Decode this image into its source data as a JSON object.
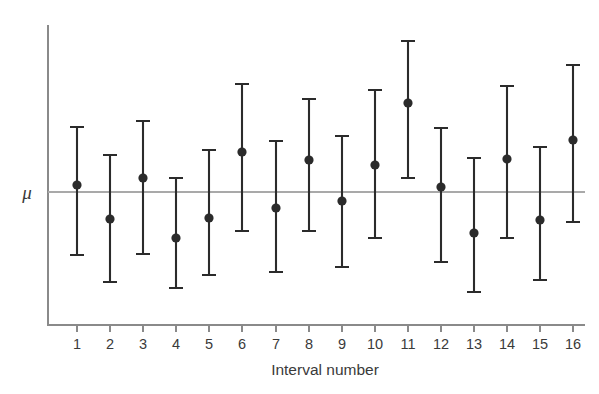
{
  "chart_data": {
    "type": "scatter",
    "title": "",
    "subtitle": "",
    "xlabel": "Interval number",
    "ylabel": "",
    "grid": false,
    "legend": false,
    "annotations": [
      {
        "name": "mu-reference-line",
        "label": "μ",
        "axis": "y",
        "value": 0.0
      }
    ],
    "axis": {
      "x_range": [
        0.4,
        16.6
      ],
      "y_range": [
        -2.6,
        2.6
      ],
      "x_ticks": [
        1,
        2,
        3,
        4,
        5,
        6,
        7,
        8,
        9,
        10,
        11,
        12,
        13,
        14,
        15,
        16
      ],
      "x_tick_labels": [
        "1",
        "2",
        "3",
        "4",
        "5",
        "6",
        "7",
        "8",
        "9",
        "10",
        "11",
        "12",
        "13",
        "14",
        "15",
        "16"
      ],
      "y_ticks": [],
      "y_tick_labels": []
    },
    "categories": [
      1,
      2,
      3,
      4,
      5,
      6,
      7,
      8,
      9,
      10,
      11,
      12,
      13,
      14,
      15,
      16
    ],
    "series": [
      {
        "name": "Confidence interval",
        "point_estimates": [
          0.17,
          -0.8,
          0.42,
          -1.38,
          -0.76,
          1.22,
          -0.49,
          0.99,
          -0.13,
          0.84,
          2.29,
          0.07,
          -1.28,
          1.06,
          -0.83,
          1.68
        ],
        "ci_upper": [
          1.92,
          1.17,
          2.11,
          0.42,
          1.32,
          3.22,
          1.52,
          2.75,
          1.77,
          2.96,
          4.37,
          1.92,
          1.07,
          3.46,
          1.43,
          3.77
        ],
        "ci_lower": [
          -1.78,
          -2.52,
          -1.72,
          -2.58,
          -2.16,
          -0.9,
          -2.16,
          -0.9,
          -1.97,
          -1.2,
          0.22,
          -1.95,
          -2.83,
          -1.2,
          -2.58,
          -0.71
        ]
      }
    ],
    "colors": {
      "marker": "#2b2b2b",
      "error_bar": "#2b2b2b",
      "axis": "#8a8a8a",
      "reference_line": "#a9a9a9",
      "text": "#3a3a3a",
      "background": "#ffffff"
    },
    "geometry": {
      "x_pixels": [
        77,
        110,
        143,
        176,
        209,
        242,
        276,
        309,
        342,
        375,
        408,
        441,
        474,
        507,
        540,
        573
      ],
      "top_pixels": [
        127,
        155,
        121,
        178,
        150,
        84,
        141,
        99,
        136,
        90,
        41,
        128,
        158,
        86,
        147,
        65
      ],
      "center_pixels": [
        185,
        219,
        178,
        238,
        218,
        152,
        208,
        160,
        201,
        165,
        103,
        187,
        233,
        159,
        220,
        140
      ],
      "bottom_pixels": [
        255,
        282,
        254,
        288,
        275,
        231,
        272,
        231,
        267,
        238,
        178,
        262,
        292,
        238,
        280,
        222
      ],
      "mu_line_y": 192,
      "axis_x": 48,
      "axis_top_y": 25,
      "axis_bottom_y": 325,
      "axis_right_x": 585,
      "cap_half_width": 7,
      "dot_radius": 4.6
    }
  },
  "labels": {
    "mu": "μ",
    "x_axis_title": "Interval number"
  }
}
